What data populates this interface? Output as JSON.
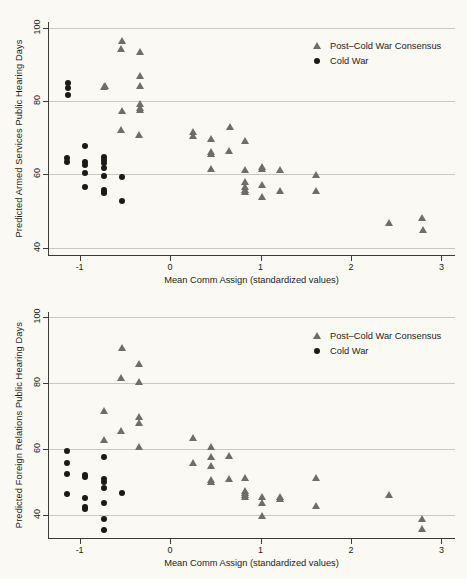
{
  "figure": {
    "background_color": "#faf9f4",
    "marker_color_consensus": "#6e6e68",
    "marker_color_coldwar": "#1a1a18"
  },
  "legend": {
    "items": [
      {
        "label": "Post–Cold War Consensus",
        "marker": "triangle-icon"
      },
      {
        "label": "Cold War",
        "marker": "circle-icon"
      }
    ]
  },
  "chart_data": [
    {
      "type": "scatter",
      "title": "",
      "xlabel": "Mean Comm Assign (standardized values)",
      "ylabel": "Predicted Armed Services Public Hearing Days",
      "xlim": [
        -1.35,
        3.15
      ],
      "ylim": [
        38.0,
        101.5
      ],
      "xticks": [
        -1,
        0,
        1,
        2,
        3
      ],
      "xticklabels": [
        "-1",
        "0",
        "1",
        "2",
        "3"
      ],
      "yticks": [
        40,
        60,
        80,
        100
      ],
      "yticklabels": [
        "40",
        "60",
        "80",
        "100"
      ],
      "grid": "horizontal",
      "legend_position": "top-right",
      "series": [
        {
          "name": "Post–Cold War Consensus",
          "marker": "triangle",
          "color": "#6e6e68",
          "points": [
            [
              -0.53,
              96.3
            ],
            [
              -0.54,
              94.2
            ],
            [
              -0.33,
              93.4
            ],
            [
              -0.33,
              86.8
            ],
            [
              -0.33,
              84.0
            ],
            [
              -0.72,
              84.1
            ],
            [
              -0.73,
              83.9
            ],
            [
              -0.33,
              79.2
            ],
            [
              -0.33,
              78.1
            ],
            [
              -0.335,
              77.6
            ],
            [
              -0.53,
              77.3
            ],
            [
              -0.54,
              72.2
            ],
            [
              -0.34,
              70.6
            ],
            [
              0.25,
              71.6
            ],
            [
              0.25,
              70.3
            ],
            [
              0.45,
              69.5
            ],
            [
              0.66,
              72.8
            ],
            [
              0.45,
              66.0
            ],
            [
              0.45,
              65.6
            ],
            [
              0.65,
              66.3
            ],
            [
              0.83,
              69.2
            ],
            [
              0.45,
              61.5
            ],
            [
              0.83,
              61.1
            ],
            [
              1.02,
              62.0
            ],
            [
              1.02,
              61.4
            ],
            [
              1.22,
              61.2
            ],
            [
              1.61,
              59.9
            ],
            [
              0.83,
              58.0
            ],
            [
              0.83,
              56.6
            ],
            [
              0.83,
              55.8
            ],
            [
              0.83,
              55.3
            ],
            [
              1.02,
              57.0
            ],
            [
              1.02,
              53.9
            ],
            [
              1.22,
              55.5
            ],
            [
              1.61,
              55.4
            ],
            [
              2.42,
              46.8
            ],
            [
              2.79,
              48.2
            ],
            [
              2.8,
              44.9
            ]
          ]
        },
        {
          "name": "Cold War",
          "marker": "circle",
          "color": "#1a1a18",
          "points": [
            [
              -1.13,
              85.0
            ],
            [
              -1.13,
              83.6
            ],
            [
              -1.13,
              81.5
            ],
            [
              -1.14,
              64.4
            ],
            [
              -1.14,
              63.4
            ],
            [
              -0.94,
              67.6
            ],
            [
              -0.94,
              63.3
            ],
            [
              -0.94,
              62.6
            ],
            [
              -0.94,
              60.3
            ],
            [
              -0.94,
              56.6
            ],
            [
              -0.73,
              64.8
            ],
            [
              -0.73,
              63.8
            ],
            [
              -0.73,
              63.2
            ],
            [
              -0.73,
              61.6
            ],
            [
              -0.73,
              59.4
            ],
            [
              -0.73,
              55.8
            ],
            [
              -0.73,
              55.3
            ],
            [
              -0.73,
              54.9
            ],
            [
              -0.53,
              59.2
            ],
            [
              -0.53,
              52.6
            ]
          ]
        }
      ]
    },
    {
      "type": "scatter",
      "title": "",
      "xlabel": "Mean Comm Assign (standardized values)",
      "ylabel": "Predicted Foreign Relations Public Hearing Days",
      "xlim": [
        -1.35,
        3.15
      ],
      "ylim": [
        33.0,
        101.5
      ],
      "xticks": [
        -1,
        0,
        1,
        2,
        3
      ],
      "xticklabels": [
        "-1",
        "0",
        "1",
        "2",
        "3"
      ],
      "yticks": [
        40,
        60,
        80,
        100
      ],
      "yticklabels": [
        "40",
        "60",
        "80",
        "100"
      ],
      "grid": "horizontal",
      "legend_position": "top-right",
      "series": [
        {
          "name": "Post–Cold War Consensus",
          "marker": "triangle",
          "color": "#6e6e68",
          "points": [
            [
              -0.53,
              90.6
            ],
            [
              -0.34,
              85.6
            ],
            [
              -0.54,
              81.4
            ],
            [
              -0.34,
              80.4
            ],
            [
              -0.73,
              71.5
            ],
            [
              -0.34,
              69.6
            ],
            [
              -0.34,
              68.0
            ],
            [
              -0.54,
              65.3
            ],
            [
              -0.73,
              62.8
            ],
            [
              -0.34,
              60.5
            ],
            [
              0.25,
              63.4
            ],
            [
              0.45,
              60.7
            ],
            [
              0.45,
              57.4
            ],
            [
              0.65,
              57.8
            ],
            [
              0.25,
              55.8
            ],
            [
              0.45,
              54.7
            ],
            [
              0.45,
              50.5
            ],
            [
              0.45,
              50.0
            ],
            [
              0.65,
              51.0
            ],
            [
              0.83,
              51.2
            ],
            [
              1.61,
              51.2
            ],
            [
              0.83,
              47.3
            ],
            [
              0.83,
              46.7
            ],
            [
              0.83,
              46.0
            ],
            [
              0.83,
              45.3
            ],
            [
              1.02,
              45.3
            ],
            [
              1.02,
              43.6
            ],
            [
              1.22,
              45.3
            ],
            [
              1.22,
              44.8
            ],
            [
              1.61,
              42.8
            ],
            [
              1.02,
              39.8
            ],
            [
              2.42,
              46.1
            ],
            [
              2.79,
              38.9
            ],
            [
              2.79,
              35.6
            ]
          ]
        },
        {
          "name": "Cold War",
          "marker": "circle",
          "color": "#1a1a18",
          "points": [
            [
              -1.14,
              59.4
            ],
            [
              -1.14,
              55.8
            ],
            [
              -1.14,
              52.3
            ],
            [
              -1.14,
              46.3
            ],
            [
              -0.94,
              52.2
            ],
            [
              -0.94,
              51.6
            ],
            [
              -0.94,
              45.2
            ],
            [
              -0.94,
              42.4
            ],
            [
              -0.94,
              41.9
            ],
            [
              -0.73,
              57.4
            ],
            [
              -0.73,
              50.8
            ],
            [
              -0.73,
              49.9
            ],
            [
              -0.73,
              48.2
            ],
            [
              -0.73,
              43.5
            ],
            [
              -0.73,
              38.9
            ],
            [
              -0.73,
              35.3
            ],
            [
              -0.53,
              46.5
            ]
          ]
        }
      ]
    }
  ]
}
